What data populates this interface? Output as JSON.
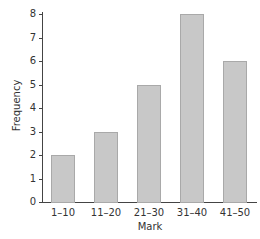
{
  "chart_data": {
    "type": "bar",
    "title": "",
    "xlabel": "Mark",
    "ylabel": "Frequency",
    "categories": [
      "1–10",
      "11–20",
      "21–30",
      "31–40",
      "41–50"
    ],
    "values": [
      2,
      3,
      5,
      8,
      6
    ],
    "ylim": [
      0,
      8
    ],
    "yticks": [
      "0",
      "1",
      "2",
      "3",
      "4",
      "5",
      "6",
      "7",
      "8"
    ],
    "grid": false,
    "legend": null,
    "bar_color": "#c8c8c8"
  }
}
